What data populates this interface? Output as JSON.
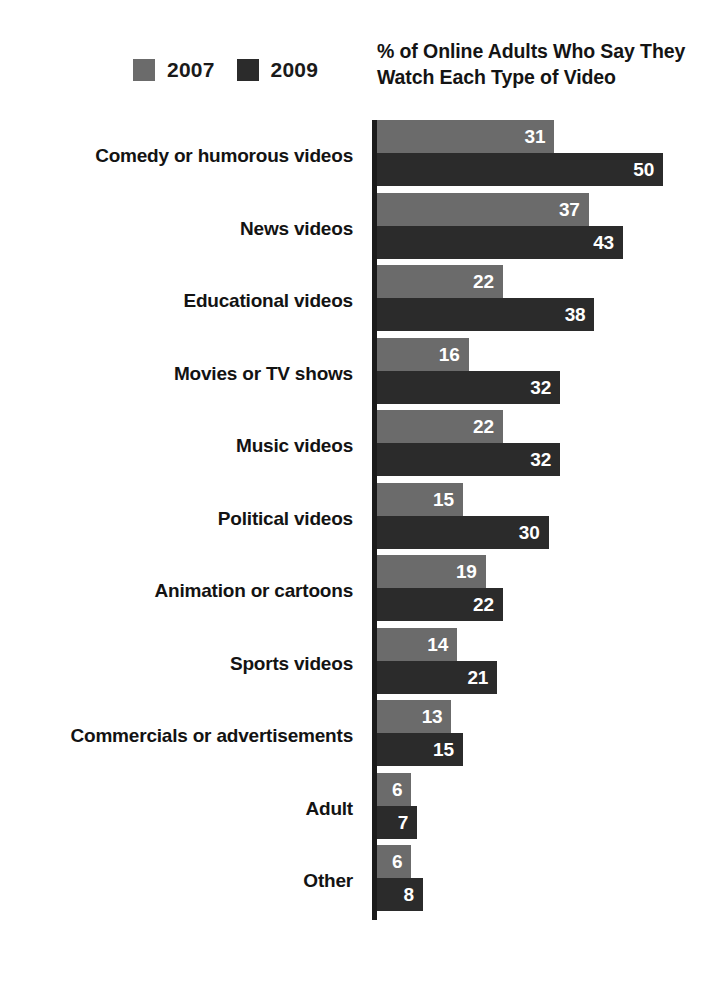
{
  "chart_data": {
    "type": "bar",
    "orientation": "horizontal",
    "grouped": true,
    "title": "% of Online Adults Who Say They Watch Each Type of Video",
    "xlabel": "",
    "ylabel": "",
    "xlim": [
      0,
      50
    ],
    "grid": false,
    "legend_position": "top-left",
    "categories": [
      "Comedy or humorous videos",
      "News videos",
      "Educational videos",
      "Movies or TV shows",
      "Music videos",
      "Political videos",
      "Animation or cartoons",
      "Sports videos",
      "Commercials or advertisements",
      "Adult",
      "Other"
    ],
    "series": [
      {
        "name": "2007",
        "color": "#6b6b6b",
        "values": [
          31,
          37,
          22,
          16,
          22,
          15,
          19,
          14,
          13,
          6,
          6
        ]
      },
      {
        "name": "2009",
        "color": "#2b2b2b",
        "values": [
          50,
          43,
          38,
          32,
          32,
          30,
          22,
          21,
          15,
          7,
          8
        ]
      }
    ]
  },
  "legend": {
    "items": [
      {
        "label": "2007",
        "color": "#6b6b6b"
      },
      {
        "label": "2009",
        "color": "#2b2b2b"
      }
    ]
  }
}
